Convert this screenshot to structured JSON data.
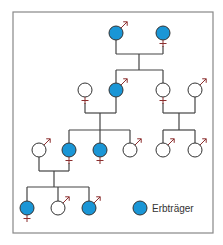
{
  "colors": {
    "carrier_fill": "#1a96d6",
    "carrier_stroke": "#333333",
    "empty_fill": "#ffffff",
    "line": "#444444",
    "symbol": "#8b2e2e",
    "frame": "#888888"
  },
  "legend": {
    "label": "Erbträger",
    "x": 140,
    "y": 208
  },
  "frame": {
    "x": 13,
    "y": 12,
    "width": 200,
    "height": 221
  },
  "individuals": [
    {
      "id": "g1-m",
      "sex": "male",
      "carrier": true,
      "x": 116,
      "y": 33
    },
    {
      "id": "g1-f",
      "sex": "female",
      "carrier": true,
      "x": 163,
      "y": 33
    },
    {
      "id": "g2-spouse-f",
      "sex": "female",
      "carrier": false,
      "x": 85,
      "y": 90
    },
    {
      "id": "g2-m",
      "sex": "male",
      "carrier": true,
      "x": 116,
      "y": 90
    },
    {
      "id": "g2-f",
      "sex": "female",
      "carrier": false,
      "x": 163,
      "y": 90
    },
    {
      "id": "g2-spouse-m",
      "sex": "male",
      "carrier": false,
      "x": 195,
      "y": 90
    },
    {
      "id": "g3-spouse-m",
      "sex": "male",
      "carrier": false,
      "x": 39,
      "y": 150
    },
    {
      "id": "g3-f1",
      "sex": "female",
      "carrier": true,
      "x": 69,
      "y": 150
    },
    {
      "id": "g3-f2",
      "sex": "female",
      "carrier": true,
      "x": 100,
      "y": 150
    },
    {
      "id": "g3-m1",
      "sex": "male",
      "carrier": false,
      "x": 130,
      "y": 150
    },
    {
      "id": "g3-m2",
      "sex": "male",
      "carrier": false,
      "x": 163,
      "y": 150
    },
    {
      "id": "g3-m3",
      "sex": "male",
      "carrier": false,
      "x": 195,
      "y": 150
    },
    {
      "id": "g4-f",
      "sex": "female",
      "carrier": true,
      "x": 27,
      "y": 208
    },
    {
      "id": "g4-m1",
      "sex": "male",
      "carrier": false,
      "x": 58,
      "y": 208
    },
    {
      "id": "g4-m2",
      "sex": "male",
      "carrier": true,
      "x": 89,
      "y": 208
    }
  ],
  "lines": [
    [
      116,
      40,
      116,
      54
    ],
    [
      163,
      46,
      163,
      54
    ],
    [
      116,
      54,
      163,
      54
    ],
    [
      139,
      54,
      139,
      70
    ],
    [
      116,
      70,
      163,
      70
    ],
    [
      116,
      70,
      116,
      83
    ],
    [
      163,
      70,
      163,
      83
    ],
    [
      85,
      103,
      85,
      113
    ],
    [
      116,
      97,
      116,
      113
    ],
    [
      85,
      113,
      116,
      113
    ],
    [
      100,
      113,
      100,
      130
    ],
    [
      69,
      130,
      130,
      130
    ],
    [
      69,
      130,
      69,
      143
    ],
    [
      100,
      130,
      100,
      143
    ],
    [
      130,
      130,
      130,
      143
    ],
    [
      163,
      103,
      163,
      113
    ],
    [
      195,
      97,
      195,
      113
    ],
    [
      163,
      113,
      195,
      113
    ],
    [
      179,
      113,
      179,
      130
    ],
    [
      163,
      130,
      195,
      130
    ],
    [
      163,
      130,
      163,
      143
    ],
    [
      195,
      130,
      195,
      143
    ],
    [
      39,
      157,
      39,
      171
    ],
    [
      69,
      163,
      69,
      171
    ],
    [
      39,
      171,
      69,
      171
    ],
    [
      54,
      171,
      54,
      187
    ],
    [
      27,
      187,
      89,
      187
    ],
    [
      27,
      187,
      27,
      201
    ],
    [
      58,
      187,
      58,
      201
    ],
    [
      89,
      187,
      89,
      201
    ]
  ]
}
